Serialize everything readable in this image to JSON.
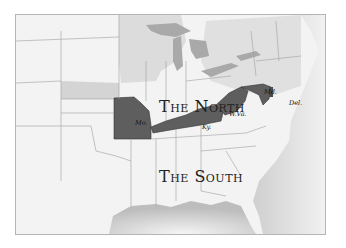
{
  "map": {
    "title": "Border states between North and South",
    "regions": [
      {
        "id": "north",
        "label": "The North"
      },
      {
        "id": "south",
        "label": "The South"
      }
    ],
    "border_states": [
      {
        "abbr": "Mo.",
        "name": "Missouri"
      },
      {
        "abbr": "Ky.",
        "name": "Kentucky"
      },
      {
        "abbr": "W.Va.",
        "name": "West Virginia"
      },
      {
        "abbr": "Md.",
        "name": "Maryland"
      },
      {
        "abbr": "Del.",
        "name": "Delaware"
      }
    ],
    "colors": {
      "border_states": "#5e5e5e",
      "north_shade": "#d6d6d6",
      "land": "#f2f2f2",
      "water": "#c9c9c9",
      "state_lines": "#9a9a9a"
    }
  }
}
